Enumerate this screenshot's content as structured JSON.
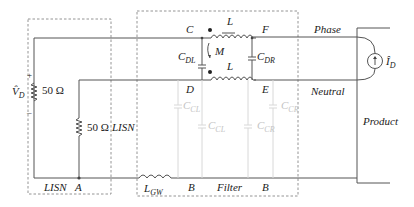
{
  "blocks": {
    "lisn": "LISN",
    "filter": "Filter",
    "product": "Product"
  },
  "lines": {
    "phase": "Phase",
    "neutral": "Neutral"
  },
  "nodes": {
    "A": "A",
    "B_left": "B",
    "B_right": "B",
    "C": "C",
    "D": "D",
    "E": "E",
    "F": "F"
  },
  "sources": {
    "voltage": {
      "symbol": "V̂",
      "sub": "D",
      "plus": "+",
      "minus": "–"
    },
    "current": {
      "symbol": "Î",
      "sub": "D"
    }
  },
  "components": {
    "r_top": "50 Ω",
    "r_bottom": "50 Ω",
    "inductor_top": "L",
    "inductor_bottom": "L",
    "mutual": "M",
    "c_dl": {
      "main": "C",
      "sub": "DL"
    },
    "c_dr": {
      "main": "C",
      "sub": "DR"
    },
    "c_cl_1": {
      "main": "C",
      "sub": "CL"
    },
    "c_cl_2": {
      "main": "C",
      "sub": "CL"
    },
    "c_cr_1": {
      "main": "C",
      "sub": "CR"
    },
    "c_cr_2": {
      "main": "C",
      "sub": "CR"
    },
    "l_gw": {
      "main": "L",
      "sub": "GW"
    }
  }
}
